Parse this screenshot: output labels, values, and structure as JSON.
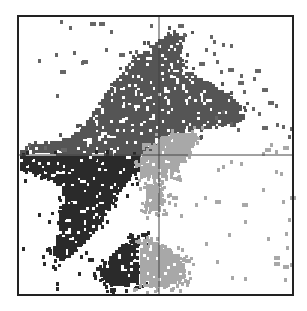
{
  "chart_data": {
    "type": "scatter",
    "subtype": "quadrant density scatter (gated populations)",
    "title": "",
    "xlabel": "",
    "ylabel": "",
    "grid": false,
    "legend": null,
    "frame": {
      "x": 18,
      "y": 16,
      "w": 275,
      "h": 279
    },
    "quadrant_lines": {
      "x": 159,
      "y": 155
    },
    "colors": {
      "background": "#ffffff",
      "frame": "#222222",
      "quadrant_line": "#444444",
      "upper_population": "#555555",
      "lower_left_population": "#2a2a2a",
      "lower_right_population": "#a8a8a8",
      "sparse_points": "#666666"
    },
    "populations": [
      {
        "name": "upper diagonal population (Q1/Q2)",
        "color_key": "upper_population",
        "polygon": [
          [
            20,
            148
          ],
          [
            40,
            143
          ],
          [
            62,
            140
          ],
          [
            80,
            130
          ],
          [
            90,
            118
          ],
          [
            100,
            102
          ],
          [
            110,
            88
          ],
          [
            122,
            72
          ],
          [
            135,
            58
          ],
          [
            150,
            46
          ],
          [
            162,
            38
          ],
          [
            175,
            30
          ],
          [
            185,
            36
          ],
          [
            180,
            55
          ],
          [
            188,
            70
          ],
          [
            200,
            78
          ],
          [
            215,
            86
          ],
          [
            230,
            95
          ],
          [
            240,
            104
          ],
          [
            245,
            118
          ],
          [
            235,
            125
          ],
          [
            215,
            128
          ],
          [
            198,
            132
          ],
          [
            175,
            133
          ],
          [
            160,
            148
          ],
          [
            145,
            155
          ],
          [
            120,
            156
          ],
          [
            100,
            154
          ],
          [
            70,
            156
          ],
          [
            40,
            153
          ],
          [
            20,
            155
          ]
        ]
      },
      {
        "name": "lower-left population (Q3)",
        "color_key": "lower_left_population",
        "polygon": [
          [
            20,
            156
          ],
          [
            60,
            156
          ],
          [
            100,
            156
          ],
          [
            140,
            157
          ],
          [
            140,
            168
          ],
          [
            130,
            180
          ],
          [
            120,
            192
          ],
          [
            112,
            202
          ],
          [
            105,
            218
          ],
          [
            95,
            232
          ],
          [
            82,
            245
          ],
          [
            70,
            258
          ],
          [
            58,
            262
          ],
          [
            52,
            250
          ],
          [
            60,
            230
          ],
          [
            58,
            214
          ],
          [
            65,
            200
          ],
          [
            60,
            186
          ],
          [
            45,
            178
          ],
          [
            30,
            172
          ],
          [
            20,
            170
          ]
        ]
      },
      {
        "name": "lower-left bottom cluster (Q3)",
        "color_key": "lower_left_population",
        "polygon": [
          [
            105,
            260
          ],
          [
            118,
            248
          ],
          [
            132,
            240
          ],
          [
            140,
            238
          ],
          [
            140,
            282
          ],
          [
            125,
            286
          ],
          [
            108,
            284
          ],
          [
            100,
            272
          ]
        ]
      },
      {
        "name": "lower-right population (Q4)",
        "color_key": "lower_right_population",
        "polygon": [
          [
            140,
            158
          ],
          [
            148,
            148
          ],
          [
            160,
            138
          ],
          [
            175,
            133
          ],
          [
            198,
            133
          ],
          [
            195,
            146
          ],
          [
            185,
            160
          ],
          [
            175,
            172
          ],
          [
            160,
            180
          ],
          [
            150,
            176
          ],
          [
            140,
            178
          ]
        ]
      },
      {
        "name": "lower-right bottom cluster (Q4)",
        "color_key": "lower_right_population",
        "polygon": [
          [
            140,
            236
          ],
          [
            150,
            240
          ],
          [
            162,
            246
          ],
          [
            175,
            252
          ],
          [
            185,
            262
          ],
          [
            186,
            276
          ],
          [
            175,
            284
          ],
          [
            160,
            288
          ],
          [
            140,
            285
          ]
        ]
      },
      {
        "name": "lower-right stream (Q4)",
        "color_key": "lower_right_population",
        "polygon": [
          [
            146,
            184
          ],
          [
            156,
            186
          ],
          [
            162,
            196
          ],
          [
            160,
            208
          ],
          [
            152,
            212
          ],
          [
            146,
            204
          ]
        ]
      }
    ],
    "sparse_points": [
      [
        55,
        53
      ],
      [
        73,
        51
      ],
      [
        82,
        60
      ],
      [
        81,
        61
      ],
      [
        60,
        70
      ],
      [
        56,
        94
      ],
      [
        38,
        59
      ],
      [
        105,
        48
      ],
      [
        119,
        53
      ],
      [
        135,
        50
      ],
      [
        110,
        30
      ],
      [
        150,
        24
      ],
      [
        69,
        26
      ],
      [
        90,
        22
      ],
      [
        99,
        22
      ],
      [
        60,
        20
      ],
      [
        178,
        24
      ],
      [
        183,
        33
      ],
      [
        210,
        35
      ],
      [
        213,
        40
      ],
      [
        222,
        43
      ],
      [
        230,
        44
      ],
      [
        205,
        48
      ],
      [
        213,
        52
      ],
      [
        216,
        60
      ],
      [
        199,
        62
      ],
      [
        220,
        70
      ],
      [
        228,
        68
      ],
      [
        240,
        74
      ],
      [
        238,
        81
      ],
      [
        255,
        69
      ],
      [
        253,
        77
      ],
      [
        243,
        90
      ],
      [
        262,
        88
      ],
      [
        268,
        101
      ],
      [
        275,
        104
      ],
      [
        252,
        107
      ],
      [
        258,
        112
      ],
      [
        262,
        126
      ],
      [
        276,
        123
      ],
      [
        282,
        125
      ],
      [
        290,
        127
      ],
      [
        237,
        128
      ],
      [
        230,
        122
      ],
      [
        222,
        110
      ],
      [
        215,
        116
      ],
      [
        28,
        143
      ],
      [
        44,
        146
      ],
      [
        61,
        148
      ],
      [
        25,
        162
      ],
      [
        34,
        170
      ],
      [
        40,
        176
      ],
      [
        45,
        168
      ],
      [
        55,
        176
      ],
      [
        58,
        196
      ],
      [
        70,
        188
      ],
      [
        38,
        213
      ],
      [
        48,
        220
      ],
      [
        22,
        247
      ],
      [
        42,
        255
      ],
      [
        52,
        265
      ],
      [
        43,
        262
      ],
      [
        80,
        255
      ],
      [
        88,
        258
      ],
      [
        78,
        272
      ],
      [
        96,
        267
      ],
      [
        56,
        282
      ],
      [
        56,
        287
      ],
      [
        103,
        282
      ],
      [
        110,
        288
      ],
      [
        165,
        175
      ],
      [
        170,
        168
      ],
      [
        172,
        196
      ],
      [
        174,
        203
      ],
      [
        180,
        214
      ],
      [
        195,
        203
      ],
      [
        204,
        196
      ],
      [
        215,
        200
      ],
      [
        217,
        168
      ],
      [
        222,
        165
      ],
      [
        242,
        203
      ],
      [
        262,
        188
      ],
      [
        275,
        170
      ],
      [
        280,
        172
      ],
      [
        282,
        200
      ],
      [
        290,
        196
      ],
      [
        244,
        220
      ],
      [
        228,
        233
      ],
      [
        216,
        260
      ],
      [
        267,
        237
      ],
      [
        285,
        232
      ],
      [
        274,
        256
      ],
      [
        274,
        262
      ],
      [
        283,
        265
      ],
      [
        290,
        263
      ],
      [
        284,
        278
      ],
      [
        231,
        276
      ],
      [
        244,
        277
      ],
      [
        205,
        242
      ],
      [
        230,
        160
      ],
      [
        240,
        162
      ],
      [
        262,
        152
      ],
      [
        275,
        150
      ],
      [
        283,
        146
      ],
      [
        270,
        143
      ],
      [
        288,
        135
      ],
      [
        265,
        148
      ],
      [
        288,
        218
      ],
      [
        286,
        246
      ]
    ]
  }
}
